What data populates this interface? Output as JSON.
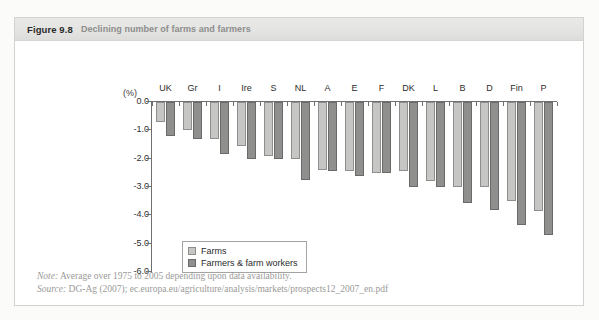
{
  "figure": {
    "number": "Figure 9.8",
    "title": "Declining number of farms and farmers"
  },
  "footer": {
    "note_key": "Note:",
    "note_text": "Average over 1975 to 2005 depending upon data availability.",
    "source_key": "Source:",
    "source_text": "DG-Ag (2007); ec.europa.eu/agriculture/analysis/markets/prospects12_2007_en.pdf"
  },
  "colors": {
    "farms": "#c6c6c4",
    "farmers": "#8f8f8d",
    "axis": "#6f6f6f",
    "title_band": "#e4e4e2",
    "title_text": "#8d8d8d"
  },
  "chart_data": {
    "type": "bar",
    "title": "Declining number of farms and farmers",
    "xlabel": "",
    "ylabel": "(%)",
    "unit_label": "(%)",
    "ylim": [
      -6.0,
      0.0
    ],
    "yticks": [
      "0.0",
      "-1.0",
      "-2.0",
      "-3.0",
      "-4.0",
      "-5.0",
      "-6.0"
    ],
    "ytick_values": [
      0.0,
      -1.0,
      -2.0,
      -3.0,
      -4.0,
      -5.0,
      -6.0
    ],
    "grid": false,
    "legend_position": "inside-lower-left",
    "categories": [
      "UK",
      "Gr",
      "I",
      "Ire",
      "S",
      "NL",
      "A",
      "E",
      "F",
      "DK",
      "L",
      "B",
      "D",
      "Fin",
      "P"
    ],
    "series": [
      {
        "name": "Farms",
        "color": "#c6c6c4",
        "values": [
          -0.7,
          -1.0,
          -1.3,
          -1.55,
          -1.9,
          -2.0,
          -2.4,
          -2.45,
          -2.5,
          -2.45,
          -2.8,
          -3.0,
          -3.0,
          -3.5,
          -3.85
        ]
      },
      {
        "name": "Farmers & farm workers",
        "color": "#8f8f8d",
        "values": [
          -1.2,
          -1.3,
          -1.85,
          -2.0,
          -2.0,
          -2.75,
          -2.45,
          -2.6,
          -2.5,
          -3.0,
          -3.0,
          -3.55,
          -3.8,
          -4.35,
          -4.7
        ]
      }
    ]
  }
}
